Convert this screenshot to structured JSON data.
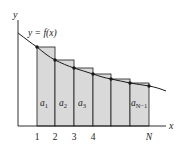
{
  "figure": {
    "curve_label": "y = f(x)",
    "axis_x_label": "x",
    "axis_y_label": "y",
    "x_ticks": [
      "1",
      "2",
      "3",
      "4",
      "N"
    ],
    "area_labels": [
      {
        "base": "a",
        "sub": "1"
      },
      {
        "base": "a",
        "sub": "2"
      },
      {
        "base": "a",
        "sub": "3"
      },
      {
        "base": "a",
        "sub": "N−1"
      }
    ],
    "colors": {
      "rect_fill": "#d9d9d9",
      "stroke": "#1a1a1a",
      "background": "#ffffff"
    }
  }
}
